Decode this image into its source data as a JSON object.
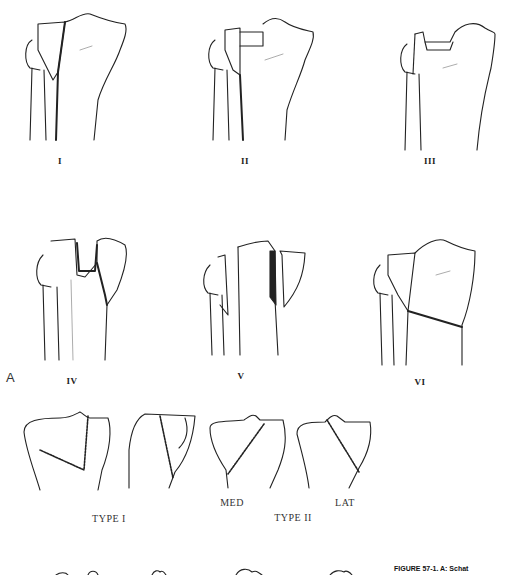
{
  "figure": {
    "part_label": "A",
    "top_row": [
      {
        "id": "I",
        "label": "I"
      },
      {
        "id": "II",
        "label": "II"
      },
      {
        "id": "III",
        "label": "III"
      }
    ],
    "middle_row": [
      {
        "id": "IV",
        "label": "IV"
      },
      {
        "id": "V",
        "label": "V"
      },
      {
        "id": "VI",
        "label": "VI"
      }
    ],
    "bottom_row": {
      "type_1_label": "TYPE I",
      "type_2_label": "TYPE II",
      "med_label": "MED",
      "lat_label": "LAT"
    },
    "caption": "FIGURE 57-1. A: Schat"
  }
}
